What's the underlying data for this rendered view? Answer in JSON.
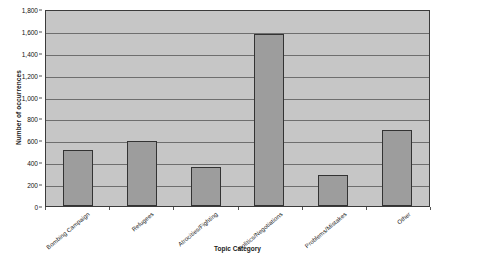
{
  "chart_data": {
    "type": "bar",
    "title": "",
    "xlabel": "Topic Category",
    "ylabel": "Number of occurrences",
    "categories": [
      "Bombing Campaign",
      "Refugees",
      "Atrocities/Fighting",
      "Politics/Negotiations",
      "Problems/Mistakes",
      "Other"
    ],
    "values": [
      510,
      590,
      360,
      1570,
      280,
      690
    ],
    "ylim": [
      0,
      1800
    ],
    "ytick_step": 200,
    "ytick_labels": [
      "0",
      "200",
      "400",
      "600",
      "800",
      "1,000",
      "1,200",
      "1,400",
      "1,600",
      "1,800"
    ],
    "ytick_values": [
      0,
      200,
      400,
      600,
      800,
      1000,
      1200,
      1400,
      1600,
      1800
    ],
    "grid": true,
    "legend": "none",
    "colors": {
      "bar_fill": "#9d9d9d",
      "bar_border": "#333333",
      "plot_background": "#c6c6c6",
      "plot_border": "#3b3b3b",
      "gridline": "#6e6e6e",
      "text": "#1a1a1a",
      "page_background": "#ffffff"
    }
  }
}
